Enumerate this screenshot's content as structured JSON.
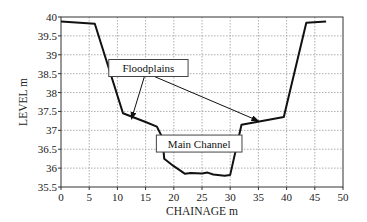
{
  "chart_data": {
    "type": "line",
    "title": "",
    "xlabel": "CHAINAGE m",
    "ylabel": "LEVEL m",
    "xlim": [
      0,
      50
    ],
    "ylim": [
      35.5,
      40
    ],
    "x_ticks": [
      "0",
      "5",
      "10",
      "15",
      "20",
      "25",
      "30",
      "35",
      "40",
      "45",
      "50"
    ],
    "y_ticks": [
      "35.5",
      "36",
      "36.5",
      "37",
      "37.5",
      "38",
      "38.5",
      "39",
      "39.5",
      "40"
    ],
    "grid": true,
    "legend": null,
    "series": [
      {
        "name": "Cross-section profile",
        "x": [
          0,
          6,
          11,
          15,
          17,
          18,
          18.3,
          20,
          22,
          23,
          25,
          26,
          27,
          29,
          30,
          32,
          39.5,
          43.5,
          47
        ],
        "y": [
          39.88,
          39.82,
          37.45,
          37.22,
          37.1,
          36.8,
          36.25,
          36.05,
          35.85,
          35.87,
          35.86,
          35.88,
          35.83,
          35.8,
          35.82,
          37.15,
          37.35,
          39.85,
          39.88
        ]
      }
    ],
    "annotations": [
      {
        "text": "Floodplains",
        "box_at": [
          15.5,
          38.65
        ],
        "arrows_to": [
          [
            12.5,
            37.3
          ],
          [
            35,
            37.25
          ]
        ]
      },
      {
        "text": "Main Channel",
        "box_at": [
          24.5,
          36.65
        ]
      }
    ]
  }
}
